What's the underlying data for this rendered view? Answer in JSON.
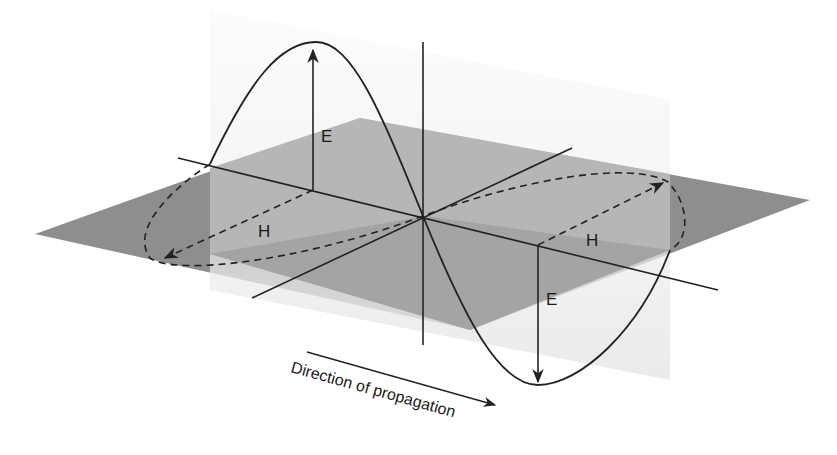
{
  "diagram": {
    "labels": {
      "e_upper": "E",
      "e_lower": "E",
      "h_left": "H",
      "h_right": "H",
      "direction": "Direction of propagation"
    },
    "components": [
      {
        "name": "electric-field",
        "symbol": "E",
        "plane": "vertical"
      },
      {
        "name": "magnetic-field",
        "symbol": "H",
        "plane": "horizontal"
      }
    ],
    "colors": {
      "horizontal_plane_dark": "#8c8c8c",
      "horizontal_plane_mid": "#b4b4b4",
      "vertical_plane": "#ececec",
      "lines": "#222222",
      "background": "#ffffff"
    }
  }
}
